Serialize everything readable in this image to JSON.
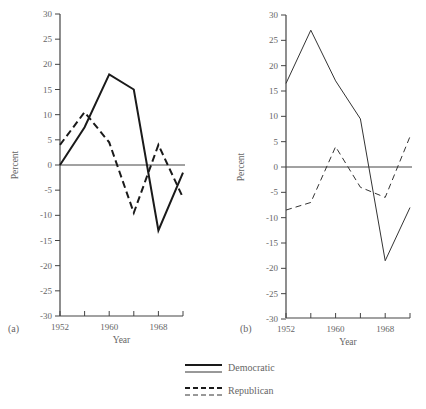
{
  "chart_data": [
    {
      "type": "line",
      "panel_label": "(a)",
      "title": "",
      "xlabel": "Year",
      "ylabel": "Percent",
      "x": [
        1952,
        1956,
        1960,
        1964,
        1968,
        1972
      ],
      "xtick_labels": [
        "1952",
        "1960",
        "1968"
      ],
      "yticks": [
        30,
        25,
        20,
        15,
        10,
        5,
        0,
        -5,
        -10,
        -15,
        -20,
        -25,
        -30
      ],
      "ylim": [
        -30,
        30
      ],
      "grid": false,
      "series": [
        {
          "name": "Democratic",
          "style": "solid-thick",
          "values": [
            0,
            7.5,
            18,
            15,
            -13,
            -1.5
          ]
        },
        {
          "name": "Republican",
          "style": "dashed-thick",
          "values": [
            4,
            10.5,
            4.5,
            -9.5,
            4,
            -6.5
          ]
        }
      ]
    },
    {
      "type": "line",
      "panel_label": "(b)",
      "title": "",
      "xlabel": "Year",
      "ylabel": "Percent",
      "x": [
        1952,
        1956,
        1960,
        1964,
        1968,
        1972
      ],
      "xtick_labels": [
        "1952",
        "1960",
        "1968"
      ],
      "yticks": [
        30,
        25,
        20,
        15,
        10,
        5,
        0,
        -5,
        -10,
        -15,
        -20,
        -25,
        -30
      ],
      "ylim": [
        -30,
        30
      ],
      "grid": false,
      "series": [
        {
          "name": "Democratic",
          "style": "solid-thin",
          "values": [
            16.5,
            27,
            17,
            9.5,
            -18.5,
            -8
          ]
        },
        {
          "name": "Republican",
          "style": "dashed-thin",
          "values": [
            -8.5,
            -7,
            4,
            -4,
            -6,
            6
          ]
        }
      ]
    }
  ],
  "legend": {
    "items": [
      {
        "label": "Democratic"
      },
      {
        "label": "Republican"
      }
    ]
  },
  "labels": {
    "panel_a": "(a)",
    "panel_b": "(b)",
    "xlabel": "Year",
    "ylabel": "Percent"
  }
}
